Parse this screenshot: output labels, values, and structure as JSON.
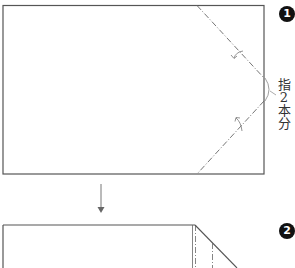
{
  "steps": [
    {
      "number": "1",
      "label": "step-1"
    },
    {
      "number": "2",
      "label": "step-2"
    }
  ],
  "annotation": {
    "chars": [
      "指",
      "2",
      "本",
      "分"
    ],
    "text": "指2本分"
  },
  "colors": {
    "line": "#555555",
    "fold_line": "#666666",
    "badge": "#111111",
    "arrow": "#777777"
  }
}
